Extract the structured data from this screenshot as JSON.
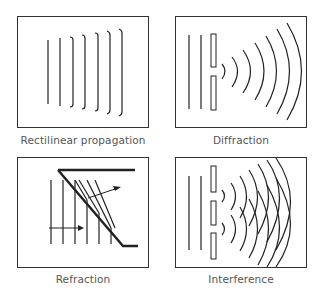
{
  "panels": [
    {
      "id": "rectilinear",
      "caption": "Rectilinear propagation"
    },
    {
      "id": "diffraction",
      "caption": "Diffraction"
    },
    {
      "id": "refraction",
      "caption": "Refraction"
    },
    {
      "id": "interference",
      "caption": "Interference"
    }
  ],
  "colors": {
    "stroke": "#222222",
    "frame": "#333333",
    "caption": "#555555"
  }
}
